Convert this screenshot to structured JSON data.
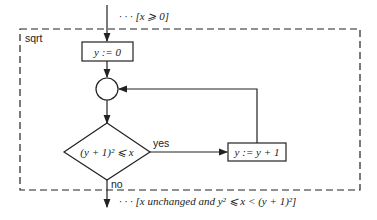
{
  "diagram": {
    "title": "sqrt",
    "precondition": "· · · [x ⩾ 0]",
    "init_box": "y := 0",
    "condition": "(y + 1)² ⩽ x",
    "yes_label": "yes",
    "no_label": "no",
    "increment_box": "y := y + 1",
    "postcondition": "· · · [x unchanged and y² ⩽ x < (y + 1)²]",
    "colors": {
      "stroke": "#222222",
      "background": "#ffffff"
    }
  }
}
